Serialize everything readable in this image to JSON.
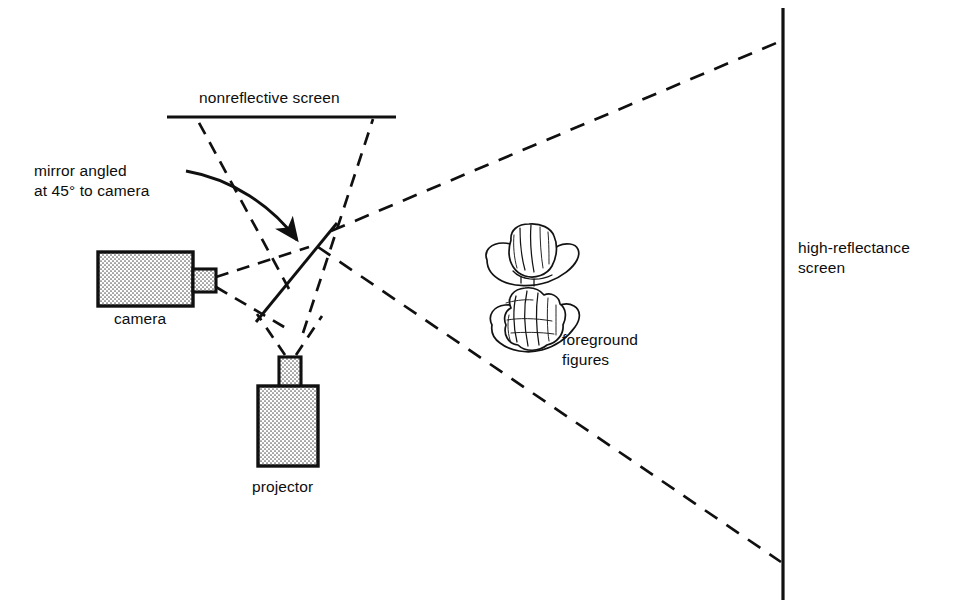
{
  "figure": {
    "background_color": "#ffffff",
    "ink_color": "#101010",
    "width": 962,
    "height": 607
  },
  "labels": {
    "nonreflective_screen": "nonreflective screen",
    "mirror_line_1": "mirror angled",
    "mirror_line_2": "at 45° to camera",
    "camera": "camera",
    "projector": "projector",
    "foreground_line_1": "foreground",
    "foreground_line_2": "figures",
    "high_reflectance_line_1": "high-reflectance",
    "high_reflectance_line_2": "screen"
  },
  "components": {
    "camera": {
      "name": "camera",
      "fill": "#dcdcdc",
      "body": {
        "x": 98,
        "y": 252,
        "w": 95,
        "h": 54
      },
      "lens": {
        "x": 193,
        "y": 269,
        "w": 23,
        "h": 23
      }
    },
    "projector": {
      "name": "projector",
      "fill": "#dcdcdc",
      "body": {
        "x": 258,
        "y": 386,
        "w": 60,
        "h": 80
      },
      "lens": {
        "x": 279,
        "y": 357,
        "w": 22,
        "h": 30
      }
    },
    "nonreflective_screen": {
      "name": "nonreflective screen",
      "x1": 167,
      "y1": 117,
      "x2": 396,
      "y2": 117,
      "stroke_width": 3.2
    },
    "high_reflectance_screen": {
      "name": "high-reflectance screen",
      "x1": 783,
      "y1": 8,
      "x2": 783,
      "y2": 600,
      "stroke_width": 3.2
    },
    "mirror": {
      "name": "mirror angled at 45 degrees to camera",
      "x1": 256,
      "y1": 322,
      "x2": 336,
      "y2": 224,
      "stroke_width": 2.9
    },
    "foreground_figures": {
      "name": "foreground figures",
      "count": 2,
      "positions": [
        {
          "cx": 532,
          "cy": 258
        },
        {
          "cx": 538,
          "cy": 318
        }
      ]
    }
  },
  "rays": {
    "camera_to_mirror_upper": {
      "x1": 216,
      "y1": 277,
      "x2": 306,
      "y2": 249
    },
    "camera_to_mirror_lower": {
      "x1": 216,
      "y1": 287,
      "x2": 290,
      "y2": 330
    },
    "mirror_to_screen_left": {
      "x1": 288,
      "y1": 288,
      "x2": 197,
      "y2": 120
    },
    "mirror_to_screen_right": {
      "x1": 300,
      "y1": 330,
      "x2": 372,
      "y2": 120
    },
    "projector_left_up": {
      "x1": 284,
      "y1": 356,
      "x2": 256,
      "y2": 316
    },
    "projector_right_up": {
      "x1": 296,
      "y1": 356,
      "x2": 320,
      "y2": 318
    },
    "converge_point": {
      "x": 331,
      "y": 231
    },
    "beam_upper_to_screen": {
      "x1": 331,
      "y1": 231,
      "x2": 781,
      "y2": 41
    },
    "beam_lower_to_screen": {
      "x1": 315,
      "y1": 250,
      "x2": 781,
      "y2": 562
    }
  },
  "label_positions": {
    "nonreflective_screen": {
      "x": 199,
      "y": 103
    },
    "mirror": {
      "x": 34,
      "y": 176
    },
    "camera": {
      "x": 114,
      "y": 324
    },
    "projector": {
      "x": 252,
      "y": 492
    },
    "foreground_figures": {
      "x": 562,
      "y": 345
    },
    "high_reflectance_screen": {
      "x": 798,
      "y": 253
    }
  }
}
